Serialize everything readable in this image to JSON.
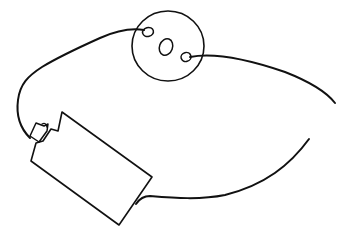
{
  "diagram": {
    "kind": "hand-drawn circuit sketch",
    "background": "#ffffff",
    "ink_color": "#111111",
    "components": [
      {
        "id": "bulb",
        "label": "light bulb (top view)",
        "shape": "circle",
        "contacts": 2
      },
      {
        "id": "battery",
        "label": "battery",
        "shape": "rotated rectangle with terminal nub"
      },
      {
        "id": "wire-left",
        "label": "wire from bulb left contact to battery terminal",
        "connected": true
      },
      {
        "id": "wire-right",
        "label": "wire from bulb right contact toward battery base",
        "connected": false
      }
    ],
    "notes": "Right-hand wire has a gap — circuit is open"
  }
}
